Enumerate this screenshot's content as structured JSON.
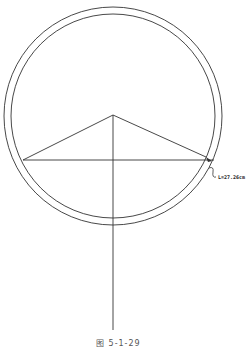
{
  "diagram": {
    "dimension_label": "L=27.26cm",
    "caption": "图 5-1-29",
    "colors": {
      "line": "#333333",
      "background": "#ffffff"
    },
    "geometry": {
      "outer_circle": {
        "cx": 113,
        "cy": 116,
        "r": 109
      },
      "inner_circle": {
        "cx": 113,
        "cy": 116,
        "r": 102
      },
      "apex": [
        113,
        115
      ],
      "chord_y": 160,
      "chord_left_x": 23,
      "chord_right_x": 212,
      "vertical_line_bottom_y": 330
    }
  }
}
